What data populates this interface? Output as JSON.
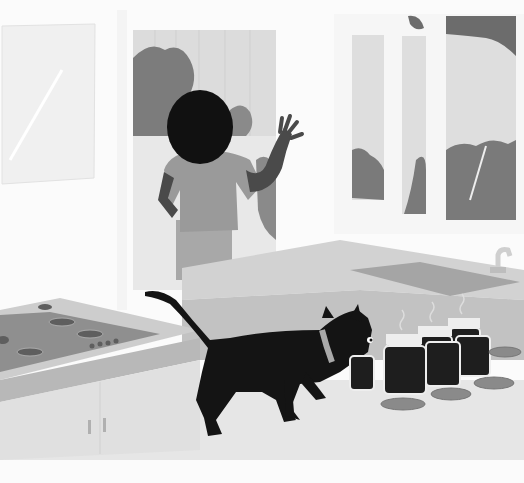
{
  "scene": {
    "title": "Kitchen scene: cat sniffing jars while person looks out window",
    "description": "Grayscale illustration of a kitchen with a stovetop, counter with sink, a black cat with a collar sniffing open jars of dark liquid, and a person standing at a window waving outside.",
    "width": 524,
    "height": 483,
    "colors": {
      "background": "#fbfbfb",
      "wall": "#f2f2f2",
      "window_glass": "#d9d9d9",
      "foliage": "#7a7a7a",
      "counter_top": "#cdcdcd",
      "counter_front": "#bcbcbc",
      "cabinet": "#e0e0e0",
      "floor": "#e6e6e6",
      "stove_plate": "#8f8f8f",
      "burner": "#5e5e5e",
      "cat": "#141414",
      "collar": "#a9a9a9",
      "jar_liquid": "#1e1e1e",
      "jar_glass": "#eeeeee",
      "jar_lid": "#8a8a8a",
      "person_hair": "#111111",
      "person_shirt": "#9c9c9c",
      "person_skin": "#4a4a4a"
    },
    "elements": {
      "left_window": "frosted window panel top-left",
      "back_window": "window with fence and bushes outside",
      "right_windows": "three-pane window with fence and trees",
      "person": "person with dark hair, hand raised, facing window",
      "stove": "stovetop with four burners and control knobs",
      "counter": "counter with sink and faucet",
      "cat": "black cat with light collar sniffing jar",
      "jars": "six open jars of dark liquid with steam",
      "lids": "five jar lids on the floor/counter"
    }
  }
}
